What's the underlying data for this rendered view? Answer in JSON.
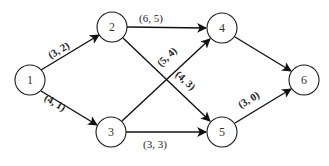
{
  "diagram": {
    "type": "directed-network",
    "nodes": [
      {
        "id": "1",
        "label": "1",
        "x": 30,
        "y": 80
      },
      {
        "id": "2",
        "label": "2",
        "x": 112,
        "y": 27
      },
      {
        "id": "3",
        "label": "3",
        "x": 111,
        "y": 132
      },
      {
        "id": "4",
        "label": "4",
        "x": 222,
        "y": 28
      },
      {
        "id": "5",
        "label": "5",
        "x": 222,
        "y": 132
      },
      {
        "id": "6",
        "label": "6",
        "x": 304,
        "y": 80
      }
    ],
    "edges": [
      {
        "from": "1",
        "to": "2",
        "label": "(3, 2)"
      },
      {
        "from": "1",
        "to": "3",
        "label": "(4, 1)"
      },
      {
        "from": "2",
        "to": "4",
        "label": "(6, 5)"
      },
      {
        "from": "2",
        "to": "5",
        "label": "(4, 3)"
      },
      {
        "from": "3",
        "to": "4",
        "label": "(5, 4)"
      },
      {
        "from": "3",
        "to": "5",
        "label": "(3, 3)"
      },
      {
        "from": "4",
        "to": "6",
        "label": ""
      },
      {
        "from": "5",
        "to": "6",
        "label": "(3, 0)"
      }
    ],
    "colors": {
      "stroke": "#111111",
      "background": "#ffffff",
      "text": "#333333"
    }
  }
}
